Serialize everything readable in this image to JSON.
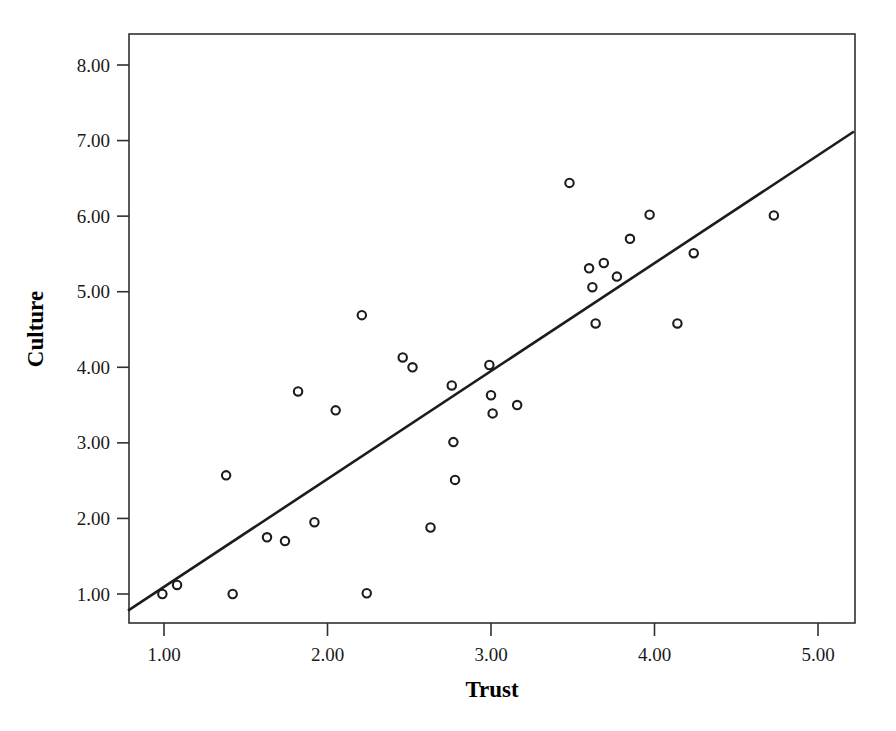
{
  "chart_data": {
    "type": "scatter",
    "title": "",
    "xlabel": "Trust",
    "ylabel": "Culture",
    "xlim": [
      0.68,
      5.22
    ],
    "ylim": [
      0.67,
      8.3
    ],
    "xticks": [
      1.0,
      2.0,
      3.0,
      4.0,
      5.0
    ],
    "xtick_labels": [
      "1.00",
      "2.00",
      "3.00",
      "4.00",
      "5.00"
    ],
    "yticks": [
      1.0,
      2.0,
      3.0,
      4.0,
      5.0,
      6.0,
      7.0,
      8.0
    ],
    "ytick_labels": [
      "1.00",
      "2.00",
      "3.00",
      "4.00",
      "5.00",
      "6.00",
      "7.00",
      "8.00"
    ],
    "grid": false,
    "legend": false,
    "marker": "open-circle",
    "marker_color": "#1c1c1c",
    "line_color": "#1c1c1c",
    "points": [
      {
        "x": 0.99,
        "y": 1.0
      },
      {
        "x": 1.08,
        "y": 1.12
      },
      {
        "x": 1.38,
        "y": 2.57
      },
      {
        "x": 1.42,
        "y": 1.0
      },
      {
        "x": 1.63,
        "y": 1.75
      },
      {
        "x": 1.74,
        "y": 1.7
      },
      {
        "x": 1.82,
        "y": 3.68
      },
      {
        "x": 1.92,
        "y": 1.95
      },
      {
        "x": 2.05,
        "y": 3.43
      },
      {
        "x": 2.21,
        "y": 4.69
      },
      {
        "x": 2.24,
        "y": 1.01
      },
      {
        "x": 2.46,
        "y": 4.13
      },
      {
        "x": 2.52,
        "y": 4.0
      },
      {
        "x": 2.63,
        "y": 1.88
      },
      {
        "x": 2.76,
        "y": 3.76
      },
      {
        "x": 2.77,
        "y": 3.01
      },
      {
        "x": 2.78,
        "y": 2.51
      },
      {
        "x": 2.99,
        "y": 4.03
      },
      {
        "x": 3.0,
        "y": 3.63
      },
      {
        "x": 3.01,
        "y": 3.39
      },
      {
        "x": 3.16,
        "y": 3.5
      },
      {
        "x": 3.48,
        "y": 6.44
      },
      {
        "x": 3.6,
        "y": 5.31
      },
      {
        "x": 3.62,
        "y": 5.06
      },
      {
        "x": 3.64,
        "y": 4.58
      },
      {
        "x": 3.69,
        "y": 5.38
      },
      {
        "x": 3.77,
        "y": 5.2
      },
      {
        "x": 3.85,
        "y": 5.7
      },
      {
        "x": 3.97,
        "y": 6.02
      },
      {
        "x": 4.14,
        "y": 4.58
      },
      {
        "x": 4.24,
        "y": 5.51
      },
      {
        "x": 4.73,
        "y": 6.01
      }
    ],
    "fit_line": {
      "name": "linear-fit",
      "x_start": 0.78,
      "y_start": 0.78,
      "x_end": 5.22,
      "y_end": 7.12
    }
  },
  "axes": {
    "x_title": "Trust",
    "y_title": "Culture"
  }
}
